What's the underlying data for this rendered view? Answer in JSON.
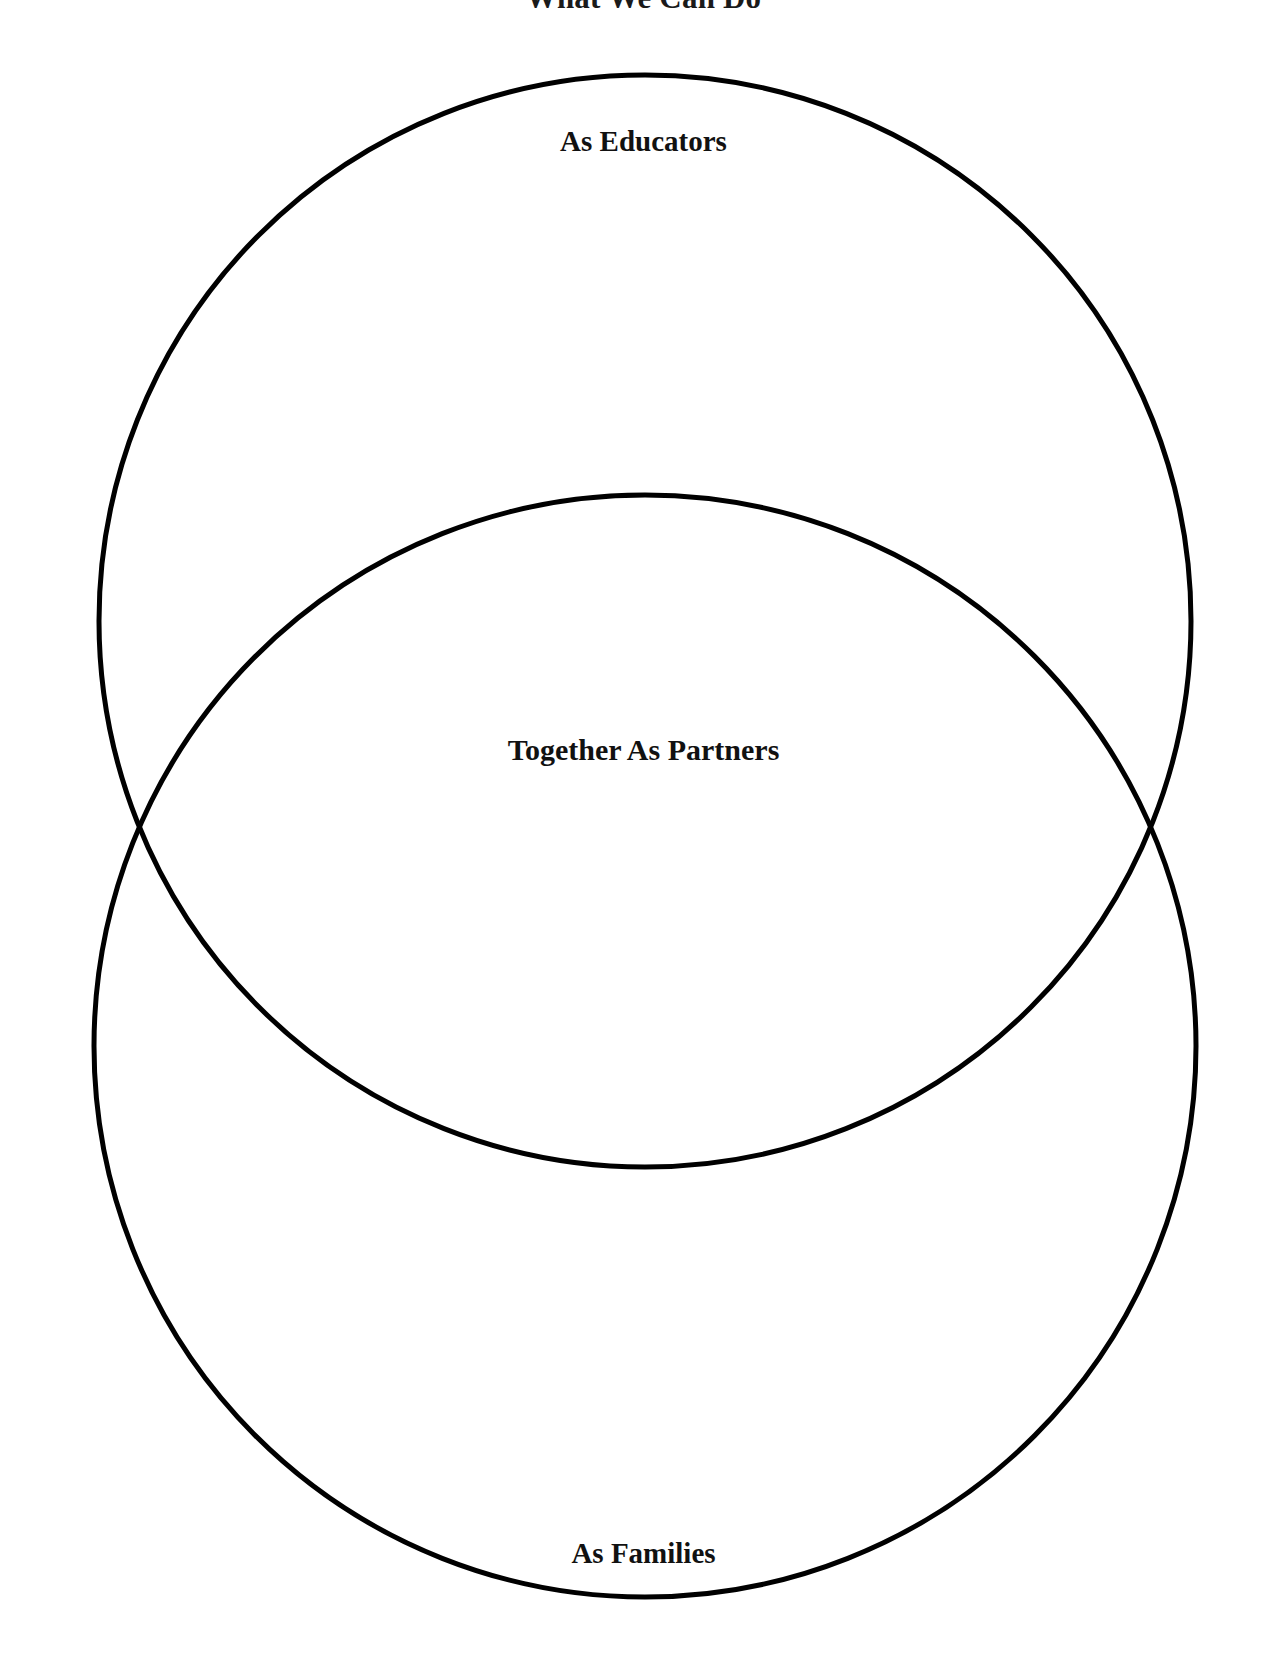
{
  "page": {
    "title": "What We Can Do",
    "background_color": "#ffffff",
    "stroke_color": "#000000"
  },
  "diagram": {
    "type": "venn",
    "set_count": 2,
    "orientation": "vertical",
    "regions": [
      {
        "id": "upper",
        "label": "As Educators",
        "label_position": "top-inside"
      },
      {
        "id": "intersection",
        "label": "Together As Partners",
        "label_position": "center"
      },
      {
        "id": "lower",
        "label": "As Families",
        "label_position": "bottom-inside"
      }
    ],
    "circles": [
      {
        "id": "upper-circle",
        "cx": 645,
        "cy": 621,
        "r": 546
      },
      {
        "id": "lower-circle",
        "cx": 645,
        "cy": 1046,
        "r": 551
      }
    ],
    "intersection_points": [
      {
        "x": 118,
        "y": 838
      },
      {
        "x": 1178,
        "y": 838
      }
    ],
    "stroke_width": 5
  },
  "chart_data": {
    "type": "diagram",
    "title": "What We Can Do",
    "categories": [
      "As Educators",
      "Together As Partners",
      "As Families"
    ],
    "values": [
      1,
      1,
      1
    ]
  }
}
